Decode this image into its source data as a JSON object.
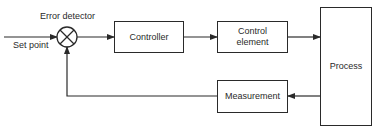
{
  "diagram": {
    "type": "feedback-control-block-diagram",
    "labels": {
      "error_detector": "Error detector",
      "set_point": "Set point"
    },
    "blocks": {
      "controller": "Controller",
      "control_element_line1": "Control",
      "control_element_line2": "element",
      "process": "Process",
      "measurement": "Measurement"
    },
    "connections": [
      {
        "from": "Set point",
        "to": "Error detector"
      },
      {
        "from": "Error detector",
        "to": "Controller"
      },
      {
        "from": "Controller",
        "to": "Control element"
      },
      {
        "from": "Control element",
        "to": "Process"
      },
      {
        "from": "Process",
        "to": "Measurement"
      },
      {
        "from": "Measurement",
        "to": "Error detector"
      }
    ],
    "colors": {
      "line": "#2a2a2a",
      "background": "#ffffff"
    }
  }
}
